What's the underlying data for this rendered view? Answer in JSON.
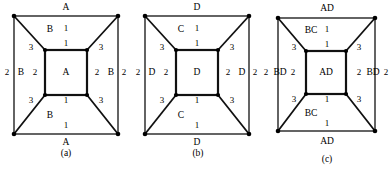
{
  "figure": {
    "panels": [
      {
        "caption": "(a)",
        "caption_x": 66,
        "caption_y": 153,
        "outer": {
          "x": 14,
          "y": 16,
          "w": 104,
          "h": 118
        },
        "inner": {
          "x": 45,
          "y": 50,
          "w": 42,
          "h": 45
        },
        "labels": [
          {
            "name": "outer-top-label",
            "text": "A",
            "x": 66,
            "y": 8,
            "num": false
          },
          {
            "name": "outer-bottom-label",
            "text": "A",
            "x": 66,
            "y": 143,
            "num": false
          },
          {
            "name": "top-region-edge-1",
            "text": "1",
            "x": 66,
            "y": 29,
            "num": true
          },
          {
            "name": "top-region-letter",
            "text": "B",
            "x": 50,
            "y": 30,
            "num": false
          },
          {
            "name": "top-region-edge-inner",
            "text": "1",
            "x": 66,
            "y": 44,
            "num": true
          },
          {
            "name": "bottom-region-edge-inner",
            "text": "1",
            "x": 66,
            "y": 101,
            "num": true
          },
          {
            "name": "bottom-region-letter",
            "text": "B",
            "x": 50,
            "y": 116,
            "num": false
          },
          {
            "name": "bottom-region-edge-1",
            "text": "1",
            "x": 66,
            "y": 126,
            "num": true
          },
          {
            "name": "left-diag-top-3",
            "text": "3",
            "x": 31,
            "y": 48,
            "num": true
          },
          {
            "name": "right-diag-top-3",
            "text": "3",
            "x": 101,
            "y": 48,
            "num": true
          },
          {
            "name": "left-diag-bottom-3",
            "text": "3",
            "x": 31,
            "y": 101,
            "num": true
          },
          {
            "name": "right-diag-bottom-3",
            "text": "3",
            "x": 101,
            "y": 101,
            "num": true
          },
          {
            "name": "left-outer-edge-2",
            "text": "2",
            "x": 7,
            "y": 73,
            "num": true
          },
          {
            "name": "left-region-letter",
            "text": "B",
            "x": 21,
            "y": 73,
            "num": false
          },
          {
            "name": "left-inner-edge-2",
            "text": "2",
            "x": 35,
            "y": 73,
            "num": true
          },
          {
            "name": "inner-square-letter",
            "text": "A",
            "x": 66,
            "y": 73,
            "num": false
          },
          {
            "name": "right-inner-edge-2",
            "text": "2",
            "x": 97,
            "y": 73,
            "num": true
          },
          {
            "name": "right-region-letter",
            "text": "B",
            "x": 111,
            "y": 73,
            "num": false
          },
          {
            "name": "right-outer-edge-2",
            "text": "2",
            "x": 124,
            "y": 73,
            "num": true
          }
        ]
      },
      {
        "caption": "(b)",
        "caption_x": 72,
        "caption_y": 153,
        "outer": {
          "x": 19,
          "y": 16,
          "w": 104,
          "h": 118
        },
        "inner": {
          "x": 50,
          "y": 50,
          "w": 42,
          "h": 45
        },
        "labels": [
          {
            "name": "outer-top-label",
            "text": "D",
            "x": 71,
            "y": 8,
            "num": false
          },
          {
            "name": "outer-bottom-label",
            "text": "D",
            "x": 71,
            "y": 143,
            "num": false
          },
          {
            "name": "top-region-edge-1",
            "text": "1",
            "x": 71,
            "y": 29,
            "num": true
          },
          {
            "name": "top-region-letter",
            "text": "C",
            "x": 55,
            "y": 30,
            "num": false
          },
          {
            "name": "top-region-edge-inner",
            "text": "1",
            "x": 71,
            "y": 44,
            "num": true
          },
          {
            "name": "bottom-region-edge-inner",
            "text": "1",
            "x": 71,
            "y": 101,
            "num": true
          },
          {
            "name": "bottom-region-letter",
            "text": "C",
            "x": 55,
            "y": 116,
            "num": false
          },
          {
            "name": "bottom-region-edge-1",
            "text": "1",
            "x": 71,
            "y": 126,
            "num": true
          },
          {
            "name": "left-diag-top-3",
            "text": "3",
            "x": 36,
            "y": 48,
            "num": true
          },
          {
            "name": "right-diag-top-3",
            "text": "3",
            "x": 106,
            "y": 48,
            "num": true
          },
          {
            "name": "left-diag-bottom-3",
            "text": "3",
            "x": 36,
            "y": 101,
            "num": true
          },
          {
            "name": "right-diag-bottom-3",
            "text": "3",
            "x": 106,
            "y": 101,
            "num": true
          },
          {
            "name": "left-outer-edge-2",
            "text": "2",
            "x": 12,
            "y": 73,
            "num": true
          },
          {
            "name": "left-region-letter",
            "text": "D",
            "x": 26,
            "y": 73,
            "num": false
          },
          {
            "name": "left-inner-edge-2",
            "text": "2",
            "x": 40,
            "y": 73,
            "num": true
          },
          {
            "name": "inner-square-letter",
            "text": "D",
            "x": 71,
            "y": 73,
            "num": false
          },
          {
            "name": "right-inner-edge-2",
            "text": "2",
            "x": 102,
            "y": 73,
            "num": true
          },
          {
            "name": "right-region-letter",
            "text": "D",
            "x": 116,
            "y": 73,
            "num": false
          },
          {
            "name": "right-outer-edge-2",
            "text": "2",
            "x": 129,
            "y": 73,
            "num": true
          }
        ]
      },
      {
        "caption": "(c)",
        "caption_x": 72,
        "caption_y": 159,
        "outer": {
          "x": 23,
          "y": 18,
          "w": 97,
          "h": 113
        },
        "inner": {
          "x": 51,
          "y": 51,
          "w": 40,
          "h": 43
        },
        "labels": [
          {
            "name": "outer-top-label",
            "text": "AD",
            "x": 72,
            "y": 9,
            "num": false
          },
          {
            "name": "outer-bottom-label",
            "text": "AD",
            "x": 72,
            "y": 142,
            "num": false
          },
          {
            "name": "top-region-edge-1",
            "text": "1",
            "x": 72,
            "y": 30,
            "num": true
          },
          {
            "name": "top-region-letter",
            "text": "BC",
            "x": 56,
            "y": 31,
            "num": false
          },
          {
            "name": "top-region-edge-inner",
            "text": "1",
            "x": 72,
            "y": 45,
            "num": true
          },
          {
            "name": "bottom-region-edge-inner",
            "text": "1",
            "x": 72,
            "y": 100,
            "num": true
          },
          {
            "name": "bottom-region-letter",
            "text": "BC",
            "x": 56,
            "y": 114,
            "num": false
          },
          {
            "name": "bottom-region-edge-1",
            "text": "1",
            "x": 72,
            "y": 124,
            "num": true
          },
          {
            "name": "left-diag-top-3",
            "text": "3",
            "x": 39,
            "y": 48,
            "num": true
          },
          {
            "name": "right-diag-top-3",
            "text": "3",
            "x": 104,
            "y": 48,
            "num": true
          },
          {
            "name": "left-diag-bottom-3",
            "text": "3",
            "x": 39,
            "y": 100,
            "num": true
          },
          {
            "name": "right-diag-bottom-3",
            "text": "3",
            "x": 104,
            "y": 100,
            "num": true
          },
          {
            "name": "left-outer-edge-2",
            "text": "2",
            "x": 11,
            "y": 73,
            "num": true
          },
          {
            "name": "left-region-letter",
            "text": "BD",
            "x": 25,
            "y": 73,
            "num": false
          },
          {
            "name": "left-inner-edge-2",
            "text": "2",
            "x": 38,
            "y": 73,
            "num": true
          },
          {
            "name": "inner-square-letter",
            "text": "AD",
            "x": 71,
            "y": 73,
            "num": false
          },
          {
            "name": "right-inner-edge-2",
            "text": "2",
            "x": 104,
            "y": 73,
            "num": true
          },
          {
            "name": "right-region-letter",
            "text": "BD",
            "x": 118,
            "y": 73,
            "num": false
          },
          {
            "name": "right-outer-edge-2",
            "text": "2",
            "x": 131,
            "y": 73,
            "num": true
          }
        ]
      }
    ],
    "colors": {
      "stroke": "#111111",
      "stroke_light": "#444444",
      "background": "#ffffff",
      "vertex": "#000000"
    }
  }
}
